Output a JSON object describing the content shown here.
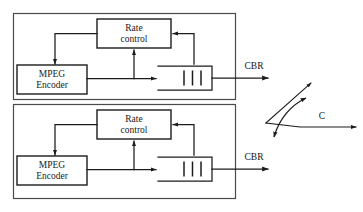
{
  "diagram": {
    "colors": {
      "stroke": "#1c1c1c",
      "outer_stroke": "#4a4a4a",
      "background": "#ffffff",
      "text": "#141414"
    },
    "groups": [
      {
        "id": "encoder-group-1",
        "name": "upper-encoder-group",
        "blocks": [
          {
            "id": "rate-control-1",
            "label_line1": "Rate",
            "label_line2": "control"
          },
          {
            "id": "mpeg-encoder-1",
            "label_line1": "MPEG",
            "label_line2": "Encoder"
          },
          {
            "id": "buffer-queue-1",
            "label": "",
            "ticks": 3
          }
        ],
        "output_label": "CBR"
      },
      {
        "id": "encoder-group-2",
        "name": "lower-encoder-group",
        "blocks": [
          {
            "id": "rate-control-2",
            "label_line1": "Rate",
            "label_line2": "control"
          },
          {
            "id": "mpeg-encoder-2",
            "label_line1": "MPEG",
            "label_line2": "Encoder"
          },
          {
            "id": "buffer-queue-2",
            "label": "",
            "ticks": 3
          }
        ],
        "output_label": "CBR"
      }
    ],
    "link": {
      "id": "shared-link",
      "label": "C",
      "description": "shared output link capacity"
    },
    "labels": {
      "rate_control_line1": "Rate",
      "rate_control_line2": "control",
      "mpeg_encoder_line1": "MPEG",
      "mpeg_encoder_line2": "Encoder",
      "cbr_upper": "CBR",
      "cbr_lower": "CBR",
      "link_capacity": "C"
    }
  }
}
